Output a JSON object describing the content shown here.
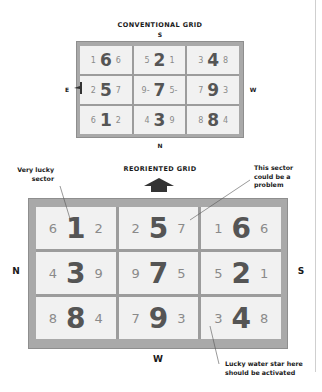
{
  "conventional": {
    "title": "CONVENTIONAL GRID",
    "directions": {
      "top": "S",
      "bottom": "N",
      "left": "E",
      "right": "W"
    },
    "cells": [
      [
        {
          "left": "1",
          "big": "6",
          "right": "6"
        },
        {
          "left": "5",
          "big": "2",
          "right": "1"
        },
        {
          "left": "3",
          "big": "4",
          "right": "8"
        }
      ],
      [
        {
          "left": "2",
          "big": "5",
          "right": "7"
        },
        {
          "left": "9-",
          "big": "7",
          "right": "5-"
        },
        {
          "left": "7",
          "big": "9",
          "right": "3"
        }
      ],
      [
        {
          "left": "6",
          "big": "1",
          "right": "2"
        },
        {
          "left": "4",
          "big": "3",
          "right": "9"
        },
        {
          "left": "8",
          "big": "8",
          "right": "4"
        }
      ]
    ]
  },
  "reoriented": {
    "title": "REORIENTED GRID",
    "directions": {
      "left": "N",
      "right": "S",
      "bottom": "W"
    },
    "cells": [
      [
        {
          "left": "6",
          "big": "1",
          "right": "2"
        },
        {
          "left": "2",
          "big": "5",
          "right": "7"
        },
        {
          "left": "1",
          "big": "6",
          "right": "6"
        }
      ],
      [
        {
          "left": "4",
          "big": "3",
          "right": "9"
        },
        {
          "left": "9",
          "big": "7",
          "right": "5"
        },
        {
          "left": "5",
          "big": "2",
          "right": "1"
        }
      ],
      [
        {
          "left": "8",
          "big": "8",
          "right": "4"
        },
        {
          "left": "7",
          "big": "9",
          "right": "3"
        },
        {
          "left": "3",
          "big": "4",
          "right": "8"
        }
      ]
    ]
  },
  "annotations": {
    "very_lucky": [
      "Very lucky",
      "sector"
    ],
    "problem": [
      "This sector",
      "could be a",
      "problem"
    ],
    "water_star": [
      "Lucky water star here",
      "should be activated"
    ]
  },
  "colors": {
    "frame": "#a9a9a9",
    "cell_bg": "#f1f1f1",
    "big_digit": "#555555",
    "small_digit": "#8a8a8a",
    "arrow": "#333333"
  }
}
